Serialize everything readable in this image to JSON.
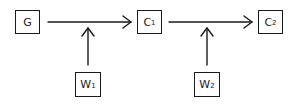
{
  "diagram": {
    "nodes": [
      {
        "id": "G",
        "label": "G",
        "sub": ""
      },
      {
        "id": "C1",
        "label": "C",
        "sub": "1"
      },
      {
        "id": "C2",
        "label": "C",
        "sub": "2"
      },
      {
        "id": "W1",
        "label": "W",
        "sub": "1"
      },
      {
        "id": "W2",
        "label": "W",
        "sub": "2"
      }
    ],
    "edges": [
      {
        "from": "G",
        "to": "C1"
      },
      {
        "from": "C1",
        "to": "C2"
      },
      {
        "from": "W1",
        "to": "edge G-C1"
      },
      {
        "from": "W2",
        "to": "edge C1-C2"
      }
    ],
    "colors": {
      "stroke": "#1a1a1a",
      "background": "#ffffff"
    }
  }
}
